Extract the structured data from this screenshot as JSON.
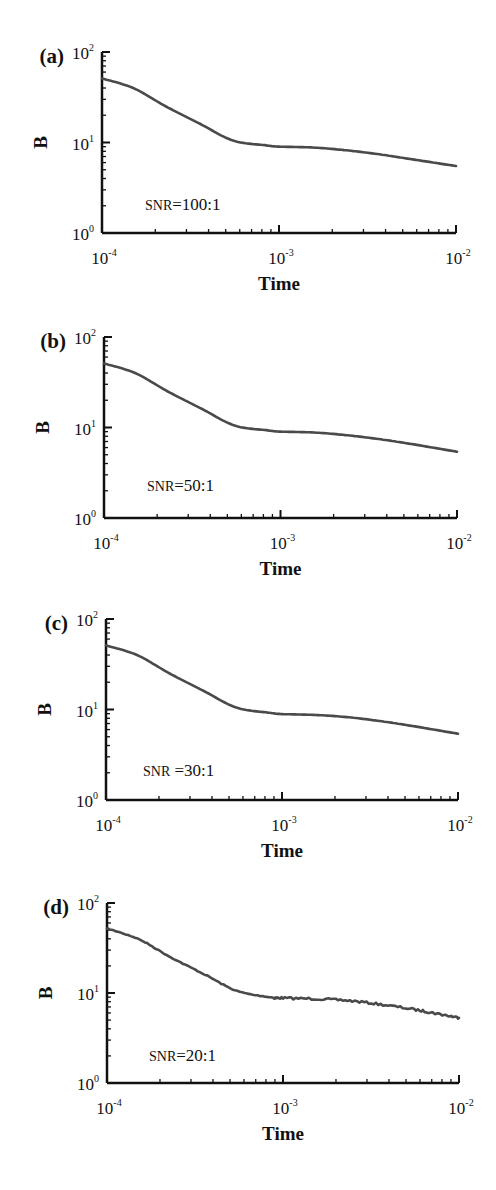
{
  "chart_data": [
    {
      "type": "line",
      "panel_label": "(a)",
      "annotation": "SNR=100:1",
      "annotation_prefix": "SNR",
      "annotation_value": "=100:1",
      "xlabel": "Time",
      "ylabel": "B",
      "xscale": "log",
      "yscale": "log",
      "xlim": [
        0.0001,
        0.01
      ],
      "ylim": [
        1,
        100
      ],
      "xticks": [
        "10^-4",
        "10^-3",
        "10^-2"
      ],
      "yticks": [
        "10^0",
        "10^1",
        "10^2"
      ],
      "grid": false,
      "series": [
        {
          "name": "B",
          "x": [
            0.0001,
            0.00015,
            0.00023,
            0.00036,
            0.00055,
            0.00085,
            0.001,
            0.00155,
            0.0024,
            0.0037,
            0.0057,
            0.01
          ],
          "y": [
            51,
            40,
            25,
            16,
            10.5,
            9.3,
            9.0,
            8.8,
            8.2,
            7.4,
            6.5,
            5.5
          ]
        }
      ]
    },
    {
      "type": "line",
      "panel_label": "(b)",
      "annotation": "SNR=50:1",
      "annotation_prefix": "SNR",
      "annotation_value": "=50:1",
      "xlabel": "Time",
      "ylabel": "B",
      "xscale": "log",
      "yscale": "log",
      "xlim": [
        0.0001,
        0.01
      ],
      "ylim": [
        1,
        100
      ],
      "xticks": [
        "10^-4",
        "10^-3",
        "10^-2"
      ],
      "yticks": [
        "10^0",
        "10^1",
        "10^2"
      ],
      "grid": false,
      "series": [
        {
          "name": "B",
          "x": [
            0.0001,
            0.00015,
            0.00023,
            0.00036,
            0.00055,
            0.00085,
            0.001,
            0.00155,
            0.0024,
            0.0037,
            0.0057,
            0.01
          ],
          "y": [
            51,
            40,
            25,
            16,
            10.5,
            9.3,
            9.0,
            8.8,
            8.2,
            7.4,
            6.5,
            5.4
          ]
        }
      ]
    },
    {
      "type": "line",
      "panel_label": "(c)",
      "annotation": "SNR =30:1",
      "annotation_prefix": "SNR",
      "annotation_value": " =30:1",
      "xlabel": "Time",
      "ylabel": "B",
      "xscale": "log",
      "yscale": "log",
      "xlim": [
        0.0001,
        0.01
      ],
      "ylim": [
        1,
        100
      ],
      "xticks": [
        "10^-4",
        "10^-3",
        "10^-2"
      ],
      "yticks": [
        "10^0",
        "10^1",
        "10^2"
      ],
      "grid": false,
      "series": [
        {
          "name": "B",
          "x": [
            0.0001,
            0.00015,
            0.00023,
            0.00036,
            0.00055,
            0.00085,
            0.001,
            0.00155,
            0.0024,
            0.0037,
            0.0057,
            0.01
          ],
          "y": [
            51,
            40,
            25,
            16,
            10.5,
            9.2,
            8.9,
            8.7,
            8.2,
            7.4,
            6.5,
            5.4
          ]
        }
      ]
    },
    {
      "type": "line",
      "panel_label": "(d)",
      "annotation": "SNR=20:1",
      "annotation_prefix": "SNR",
      "annotation_value": "=20:1",
      "xlabel": "Time",
      "ylabel": "B",
      "xscale": "log",
      "yscale": "log",
      "xlim": [
        0.0001,
        0.01
      ],
      "ylim": [
        1,
        100
      ],
      "xticks": [
        "10^-4",
        "10^-3",
        "10^-2"
      ],
      "yticks": [
        "10^0",
        "10^1",
        "10^2"
      ],
      "grid": false,
      "noisy": true,
      "series": [
        {
          "name": "B",
          "x": [
            0.0001,
            0.00015,
            0.00023,
            0.00036,
            0.00055,
            0.00085,
            0.001,
            0.00155,
            0.0024,
            0.0037,
            0.0057,
            0.0075,
            0.01
          ],
          "y": [
            52,
            40,
            25,
            16,
            10.5,
            9.0,
            8.8,
            8.6,
            8.2,
            7.4,
            6.5,
            5.9,
            5.3
          ]
        }
      ]
    }
  ],
  "style": {
    "curve_color": "#4a4a4a",
    "axis_color": "#111111"
  },
  "layout": {
    "panels": [
      {
        "left": 102,
        "top": 52,
        "right": 456,
        "bottom": 233
      },
      {
        "left": 104,
        "top": 337,
        "right": 457,
        "bottom": 518
      },
      {
        "left": 106,
        "top": 619,
        "right": 458,
        "bottom": 800
      },
      {
        "left": 107,
        "top": 903,
        "right": 459,
        "bottom": 1083
      }
    ],
    "annotation_pos": [
      {
        "x": 145,
        "y": 210
      },
      {
        "x": 147,
        "y": 491
      },
      {
        "x": 143,
        "y": 776
      },
      {
        "x": 149,
        "y": 1061
      }
    ]
  }
}
